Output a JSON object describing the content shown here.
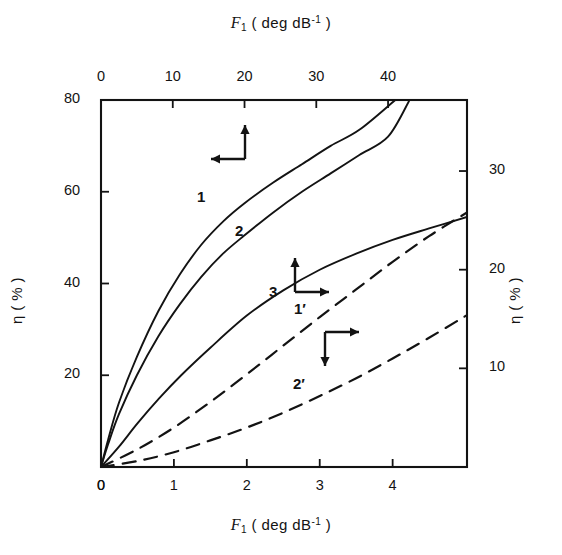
{
  "figure": {
    "background": "#ffffff",
    "ink": "#131313"
  },
  "axes": {
    "top": {
      "title_symbol": "F",
      "title_sub": "1",
      "title_unit_open": "  ( deg  dB",
      "title_sup": "-1",
      "title_unit_close": " )",
      "ticks": [
        "0",
        "10",
        "20",
        "30",
        "40"
      ],
      "tick_values": [
        0,
        10,
        20,
        30,
        40
      ],
      "range": [
        0,
        51
      ]
    },
    "bottom": {
      "title_symbol": "F",
      "title_sub": "1",
      "title_unit_open": "  ( deg  dB",
      "title_sup": "-1",
      "title_unit_close": " )",
      "ticks": [
        "0",
        "1",
        "2",
        "3",
        "4"
      ],
      "tick_values": [
        0,
        1,
        2,
        3,
        4
      ],
      "range": [
        0,
        5.02
      ]
    },
    "left": {
      "title_symbol": "η",
      "title_unit": " ( % )",
      "ticks": [
        "0",
        "20",
        "40",
        "60",
        "80"
      ],
      "tick_values": [
        0,
        20,
        40,
        60,
        80
      ],
      "range": [
        0,
        80
      ]
    },
    "right": {
      "title_symbol": "η",
      "title_unit": " ( % )",
      "ticks": [
        "10",
        "20",
        "30"
      ],
      "tick_values": [
        10,
        20,
        30
      ],
      "range": [
        0,
        37.2
      ]
    }
  },
  "curve_labels": [
    {
      "text": "1",
      "x": 197,
      "y": 188
    },
    {
      "text": "2",
      "x": 235,
      "y": 222
    },
    {
      "text": "3",
      "x": 269,
      "y": 283
    },
    {
      "text": "1′",
      "x": 294,
      "y": 300
    },
    {
      "text": "2′",
      "x": 293,
      "y": 375
    }
  ],
  "arrow_groups": [
    {
      "name": "upper-left-axis-pointer",
      "corner_x": 245,
      "corner_y": 159,
      "vertical": "up",
      "horizontal": "left"
    },
    {
      "name": "curve-3-axis-pointer",
      "corner_x": 295,
      "corner_y": 292,
      "vertical": "up",
      "horizontal": "right"
    },
    {
      "name": "dashed-curves-axis-pointer",
      "corner_x": 325,
      "corner_y": 332,
      "vertical": "down",
      "horizontal": "right"
    }
  ],
  "chart_data": {
    "type": "line",
    "title": "",
    "xlabel": "F1 (deg dB^-1)",
    "ylabel": "η (%)",
    "grid": false,
    "legend": "inline curve labels",
    "axis_pairs": [
      {
        "curves": [
          "1",
          "2"
        ],
        "x_axis": "top",
        "y_axis": "left",
        "x_range": [
          0,
          51
        ],
        "y_range": [
          0,
          80
        ]
      },
      {
        "curves": [
          "3"
        ],
        "x_axis": "bottom",
        "y_axis": "left",
        "x_range": [
          0,
          5.02
        ],
        "y_range": [
          0,
          80
        ]
      },
      {
        "curves": [
          "1′",
          "2′"
        ],
        "x_axis": "bottom",
        "y_axis": "right",
        "x_range": [
          0,
          5.02
        ],
        "y_range": [
          0,
          37.2
        ]
      }
    ],
    "series": [
      {
        "name": "1",
        "style": "solid",
        "x_axis": "top",
        "y_axis": "left",
        "x": [
          0,
          1,
          2.5,
          5,
          8,
          11,
          14,
          17,
          20,
          24,
          28,
          32,
          36,
          41
        ],
        "y": [
          0,
          6,
          14,
          24,
          34,
          42,
          48.5,
          53.5,
          57.5,
          62,
          66,
          70,
          73.5,
          80
        ]
      },
      {
        "name": "2",
        "style": "solid",
        "x_axis": "top",
        "y_axis": "left",
        "x": [
          0,
          1,
          2.5,
          5,
          8,
          11,
          14,
          17,
          20,
          24,
          28,
          32,
          36,
          40,
          43
        ],
        "y": [
          0,
          5,
          11.5,
          20,
          28.5,
          35.5,
          41.5,
          46.5,
          50.5,
          55.5,
          60,
          64,
          68,
          72,
          80
        ]
      },
      {
        "name": "3",
        "style": "solid",
        "x_axis": "bottom",
        "y_axis": "left",
        "x": [
          0,
          0.25,
          0.5,
          0.8,
          1.1,
          1.5,
          2.0,
          2.5,
          3.0,
          3.5,
          4.0,
          4.5,
          5.02
        ],
        "y": [
          0,
          4.5,
          9.5,
          15,
          20,
          26,
          33,
          38.5,
          43,
          46.5,
          49.5,
          52,
          54.5
        ]
      },
      {
        "name": "1′",
        "style": "dashed",
        "x_axis": "bottom",
        "y_axis": "right",
        "x": [
          0,
          0.5,
          1.0,
          1.5,
          2.0,
          2.5,
          3.0,
          3.5,
          4.0,
          4.5,
          5.02
        ],
        "y": [
          0,
          1.8,
          4.0,
          6.6,
          9.4,
          12.3,
          15.2,
          18.0,
          20.8,
          23.4,
          25.8
        ]
      },
      {
        "name": "2′",
        "style": "dashed",
        "x_axis": "bottom",
        "y_axis": "right",
        "x": [
          0,
          0.5,
          1.0,
          1.5,
          2.0,
          2.5,
          3.0,
          3.5,
          4.0,
          4.5,
          5.02
        ],
        "y": [
          0,
          0.6,
          1.5,
          2.7,
          4.0,
          5.5,
          7.2,
          9.0,
          11.0,
          13.1,
          15.4
        ]
      }
    ]
  }
}
